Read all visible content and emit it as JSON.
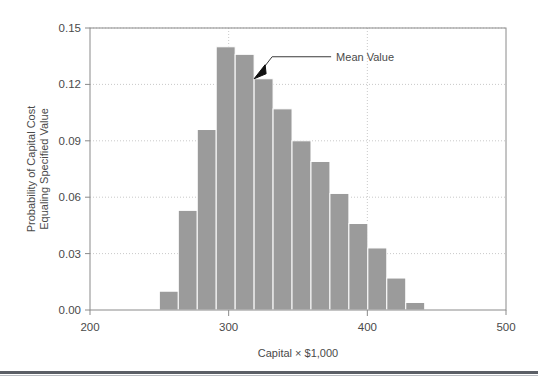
{
  "chart_data": {
    "type": "bar",
    "title": "",
    "subtitle": "",
    "xlabel": "Capital × $1,000",
    "ylabel_line1": "Probability of Capital Cost",
    "ylabel_line2": "Equaling Specified Value",
    "xlim": [
      200,
      500
    ],
    "ylim": [
      0,
      0.15
    ],
    "grid": true,
    "legend": "none",
    "xticks": [
      200,
      300,
      400,
      500
    ],
    "xtick_labels": [
      "200",
      "300",
      "400",
      "500"
    ],
    "yticks": [
      0.0,
      0.03,
      0.06,
      0.09,
      0.12,
      0.15
    ],
    "ytick_labels": [
      "0.00",
      "0.03",
      "0.06",
      "0.09",
      "0.12",
      "0.15"
    ],
    "bin_width": 13.67,
    "bin_start": 250,
    "categories": [
      "250-264",
      "264-277",
      "277-291",
      "291-305",
      "305-318",
      "318-332",
      "332-346",
      "346-359",
      "359-373",
      "373-387",
      "387-400",
      "400-414",
      "414-428",
      "428-441",
      "441-455"
    ],
    "bin_centers": [
      256.8,
      270.5,
      284.2,
      297.8,
      311.5,
      325.2,
      338.8,
      352.5,
      366.2,
      379.8,
      393.5,
      407.2,
      420.8,
      434.5,
      448.2
    ],
    "values": [
      0.01,
      0.053,
      0.096,
      0.14,
      0.136,
      0.123,
      0.107,
      0.09,
      0.079,
      0.062,
      0.046,
      0.033,
      0.017,
      0.004,
      0.0
    ],
    "bar_color": "#9b9b9b",
    "bar_edge_color": "#ffffff",
    "annotations": [
      {
        "name": "mean-value",
        "label": "Mean Value",
        "points_to_bin_index": 5,
        "points_to_value": 0.123
      }
    ]
  },
  "colors": {
    "bar": "#9b9b9b",
    "axis": "#8a8a8a",
    "grid": "#c9c9c9",
    "text": "#4a4a4a",
    "rule": "#5b5f66"
  }
}
